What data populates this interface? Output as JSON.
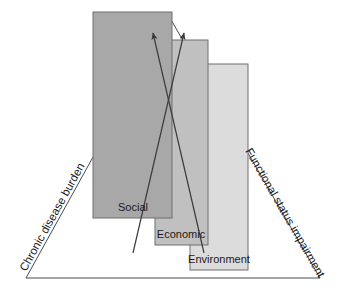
{
  "figure": {
    "type": "conceptual-triangle-diagram",
    "background": "#ffffff"
  },
  "triangle": {
    "apex": {
      "x": 170,
      "y": 18
    },
    "left_base": {
      "x": 26,
      "y": 278
    },
    "right_base": {
      "x": 320,
      "y": 278
    },
    "stroke_color": "#4a4a4a",
    "left_side_label": "Chronic disease burden",
    "right_side_label": "Functional status impairment",
    "base_label": ""
  },
  "boxes": [
    {
      "label": "Social",
      "fill": "#a8a8a8",
      "stroke": "#6e6e6e",
      "x": 93,
      "y": 12,
      "width": 79,
      "height": 206,
      "label_x": 133,
      "label_y": 211
    },
    {
      "label": "Economic",
      "fill": "#c0c0c0",
      "stroke": "#6e6e6e",
      "x": 155,
      "y": 40,
      "width": 53,
      "height": 205,
      "label_x": 181,
      "label_y": 238
    },
    {
      "label": "Environment",
      "fill": "#dcdcdc",
      "stroke": "#6e6e6e",
      "x": 190,
      "y": 64,
      "width": 58,
      "height": 206,
      "label_x": 219,
      "label_y": 263
    }
  ],
  "arrows": [
    {
      "name": "left-crossing-arrow",
      "from": {
        "x": 204,
        "y": 253
      },
      "to": {
        "x": 152,
        "y": 32
      },
      "stroke": "#3a3a3a",
      "head": "filled-triangle"
    },
    {
      "name": "right-crossing-arrow",
      "from": {
        "x": 133,
        "y": 253
      },
      "to": {
        "x": 185,
        "y": 32
      },
      "stroke": "#3a3a3a",
      "head": "filled-triangle"
    }
  ],
  "colors": {
    "box_dark": "#a8a8a8",
    "box_mid": "#c0c0c0",
    "box_light": "#dcdcdc",
    "line": "#4a4a4a",
    "text": "#1a1a1a"
  }
}
